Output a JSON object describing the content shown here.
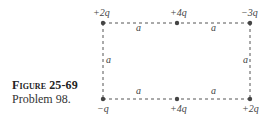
{
  "caption": {
    "title": "Figure 25-69",
    "subtitle": "Problem 98."
  },
  "charges": {
    "top_left": "+2q",
    "top_middle": "+4q",
    "top_right": "−3q",
    "bottom_left": "−q",
    "bottom_middle": "+4q",
    "bottom_right": "+2q"
  },
  "segments": {
    "top_left": "a",
    "top_right": "a",
    "left_side": "a",
    "right_side": "a",
    "bottom_left": "a",
    "bottom_right": "a"
  },
  "colors": {
    "line": "#555555",
    "dot": "#444444"
  }
}
